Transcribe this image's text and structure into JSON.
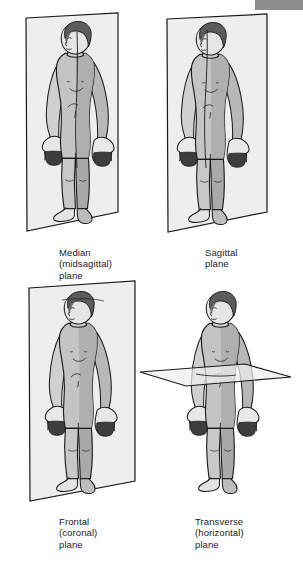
{
  "diagram": {
    "artifact": {
      "name": "corner-grey-bar",
      "color": "#8d8d8d"
    },
    "palette": {
      "plane_fill": "#eeeeee",
      "plane_stroke": "#1a1a1a",
      "skin_light": "#f2f2f2",
      "skin_shadow": "#a9a9a9",
      "skin_mid": "#c9c9c9",
      "hair": "#5c5c5c",
      "outline": "#1a1a1a",
      "text": "#1c1c1c",
      "background": "#ffffff"
    },
    "panels": [
      {
        "id": "median",
        "plane_type": "vertical-sagittal",
        "label_lines": [
          "Median",
          "(midsagittal)",
          "plane"
        ],
        "label_text": "Median\n(midsagittal)\nplane"
      },
      {
        "id": "sagittal",
        "plane_type": "vertical-parasagittal",
        "label_lines": [
          "Sagittal",
          "plane"
        ],
        "label_text": "Sagittal\nplane"
      },
      {
        "id": "frontal",
        "plane_type": "vertical-coronal",
        "label_lines": [
          "Frontal",
          "(coronal)",
          "plane"
        ],
        "label_text": "Frontal\n(coronal)\nplane"
      },
      {
        "id": "transverse",
        "plane_type": "horizontal",
        "label_lines": [
          "Transverse",
          "(horizontal)",
          "plane"
        ],
        "label_text": "Transverse\n(horizontal)\nplane"
      }
    ]
  }
}
